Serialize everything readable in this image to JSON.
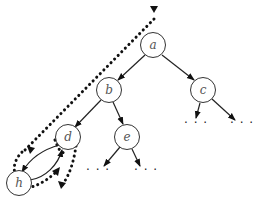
{
  "diagram": {
    "type": "binary-tree-traversal",
    "nodes": [
      {
        "id": "a",
        "label": "a",
        "x": 153,
        "y": 45
      },
      {
        "id": "b",
        "label": "b",
        "x": 109,
        "y": 90
      },
      {
        "id": "c",
        "label": "c",
        "x": 203,
        "y": 90
      },
      {
        "id": "d",
        "label": "d",
        "x": 68,
        "y": 137
      },
      {
        "id": "e",
        "label": "e",
        "x": 127,
        "y": 137
      },
      {
        "id": "h",
        "label": "h",
        "x": 19,
        "y": 183
      }
    ],
    "edges": [
      {
        "from": "a",
        "to": "b"
      },
      {
        "from": "a",
        "to": "c"
      },
      {
        "from": "b",
        "to": "d"
      },
      {
        "from": "b",
        "to": "e"
      },
      {
        "from": "d",
        "to": "h"
      },
      {
        "from": "h",
        "to": "d"
      },
      {
        "from": "c",
        "to": "…"
      },
      {
        "from": "c",
        "to": "…"
      },
      {
        "from": "e",
        "to": "…"
      },
      {
        "from": "e",
        "to": "…"
      }
    ],
    "ellipsis_label": "· · ·",
    "traversal_path": "dotted arrow descending from top toward d, looping around h and back to d"
  }
}
